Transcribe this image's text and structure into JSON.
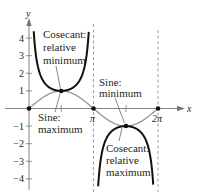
{
  "chart_data": {
    "type": "line",
    "title": "",
    "xlabel": "x",
    "ylabel": "y",
    "xlim": [
      0,
      6.2832
    ],
    "ylim": [
      -4.5,
      4.5
    ],
    "grid": false,
    "x_ticks": [
      {
        "value": 1.5708,
        "label": ""
      },
      {
        "value": 3.1416,
        "label": "π"
      },
      {
        "value": 4.7124,
        "label": ""
      },
      {
        "value": 6.2832,
        "label": "2π"
      }
    ],
    "y_ticks": [
      {
        "value": 4,
        "label": "4"
      },
      {
        "value": 3,
        "label": "3"
      },
      {
        "value": 2,
        "label": "2"
      },
      {
        "value": 1,
        "label": "1"
      },
      {
        "value": -1,
        "label": "−1"
      },
      {
        "value": -2,
        "label": "−2"
      },
      {
        "value": -3,
        "label": "−3"
      },
      {
        "value": -4,
        "label": "−4"
      }
    ],
    "series": [
      {
        "name": "y = sin x",
        "color": "#9a9a9a",
        "function": "sin",
        "x_range": [
          0,
          6.2832
        ]
      },
      {
        "name": "y = csc x",
        "color": "#111111",
        "function": "csc",
        "x_range": [
          [
            0.23,
            2.91
          ],
          [
            3.37,
            6.05
          ]
        ]
      }
    ],
    "asymptotes": [
      3.1416,
      6.2832
    ],
    "points": [
      {
        "x": 0,
        "y": 0
      },
      {
        "x": 1.5708,
        "y": 1
      },
      {
        "x": 3.1416,
        "y": 0
      },
      {
        "x": 4.7124,
        "y": -1
      },
      {
        "x": 6.2832,
        "y": 0
      }
    ],
    "annotations": [
      {
        "lines": [
          "Cosecant:",
          "relative",
          "minimum"
        ],
        "point": [
          1.5708,
          1
        ]
      },
      {
        "lines": [
          "Sine:",
          "maximum"
        ],
        "point": [
          1.5708,
          1
        ]
      },
      {
        "lines": [
          "Sine:",
          "minimum"
        ],
        "point": [
          4.7124,
          -1
        ]
      },
      {
        "lines": [
          "Cosecant:",
          "relative",
          "maximum"
        ],
        "point": [
          4.7124,
          -1
        ]
      }
    ]
  },
  "labels": {
    "y_axis": "y",
    "x_axis": "x",
    "pi": "π",
    "two_pi": "2π",
    "csc_min": [
      "Cosecant:",
      "relative",
      "minimum"
    ],
    "sin_max": [
      "Sine:",
      "maximum"
    ],
    "sin_min": [
      "Sine:",
      "minimum"
    ],
    "csc_max": [
      "Cosecant:",
      "relative",
      "maximum"
    ],
    "y_tick_labels": [
      "4",
      "3",
      "2",
      "1",
      "−1",
      "−2",
      "−3",
      "−4"
    ]
  }
}
